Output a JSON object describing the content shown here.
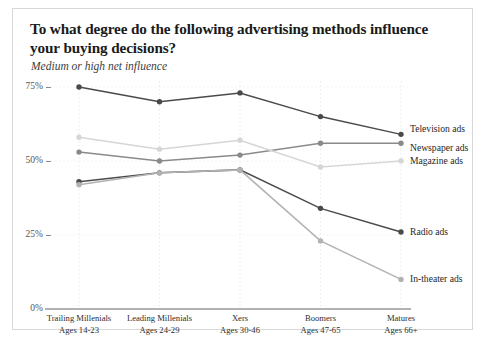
{
  "card": {
    "title": "To what degree do the following advertising methods influence your buying decisions?",
    "subtitle": "Medium or high net influence"
  },
  "chart_data": {
    "type": "line",
    "title": "To what degree do the following advertising methods influence your buying decisions?",
    "subtitle": "Medium or high net influence",
    "xlabel": "",
    "ylabel": "",
    "ylim": [
      0,
      75
    ],
    "ytick_labels": [
      "0%",
      "25%",
      "50%",
      "75%"
    ],
    "ytick_values": [
      0,
      25,
      50,
      75
    ],
    "grid": "dotted-vertical",
    "legend_position": "right-of-line-end",
    "categories": [
      "Trailing Millenials",
      "Leading Millenials",
      "Xers",
      "Boomers",
      "Matures"
    ],
    "category_sublabels": [
      "Ages 14-23",
      "Ages 24-29",
      "Ages 30-46",
      "Ages 47-65",
      "Ages 66+"
    ],
    "series": [
      {
        "name": "Television ads",
        "color": "#4a4a4a",
        "values": [
          75,
          70,
          73,
          65,
          59
        ]
      },
      {
        "name": "Newspaper ads",
        "color": "#8a8a8a",
        "values": [
          53,
          50,
          52,
          56,
          56
        ]
      },
      {
        "name": "Magazine ads",
        "color": "#d6d6d6",
        "values": [
          58,
          54,
          57,
          48,
          50
        ]
      },
      {
        "name": "Radio ads",
        "color": "#4a4a4a",
        "values": [
          43,
          46,
          47,
          34,
          26
        ]
      },
      {
        "name": "In-theater ads",
        "color": "#b2b2b2",
        "values": [
          42,
          46,
          47,
          23,
          10
        ]
      }
    ]
  }
}
